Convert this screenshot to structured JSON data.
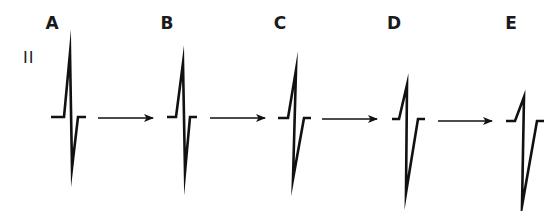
{
  "diagram": {
    "lead_label": "II",
    "stroke_color": "#111111",
    "panels": [
      {
        "label": "A",
        "label_x": 52,
        "baseline_y": 117,
        "pre": [
          51,
          64
        ],
        "peak": [
          70,
          53
        ],
        "trough": [
          72,
          168
        ],
        "post": [
          78,
          86
        ]
      },
      {
        "label": "B",
        "label_x": 167,
        "baseline_y": 117,
        "pre": [
          167,
          176
        ],
        "peak": [
          183,
          63
        ],
        "trough": [
          185,
          172
        ],
        "post": [
          190,
          197
        ]
      },
      {
        "label": "C",
        "label_x": 280,
        "baseline_y": 118,
        "pre": [
          278,
          288
        ],
        "peak": [
          296,
          70
        ],
        "trough": [
          293,
          179
        ],
        "post": [
          304,
          311
        ]
      },
      {
        "label": "D",
        "label_x": 394,
        "baseline_y": 119,
        "pre": [
          392,
          399
        ],
        "peak": [
          407,
          85
        ],
        "trough": [
          406,
          193
        ],
        "post": [
          418,
          425
        ]
      },
      {
        "label": "E",
        "label_x": 511,
        "baseline_y": 121,
        "pre": [
          506,
          515
        ],
        "peak": [
          524,
          97
        ],
        "trough": [
          522,
          206
        ],
        "post": [
          537,
          544
        ]
      }
    ],
    "arrows": [
      {
        "from": "A",
        "to": "B",
        "x1": 98,
        "x2": 153,
        "y": 118
      },
      {
        "from": "B",
        "to": "C",
        "x1": 210,
        "x2": 265,
        "y": 118
      },
      {
        "from": "C",
        "to": "D",
        "x1": 322,
        "x2": 377,
        "y": 119
      },
      {
        "from": "D",
        "to": "E",
        "x1": 438,
        "x2": 492,
        "y": 121
      }
    ]
  }
}
